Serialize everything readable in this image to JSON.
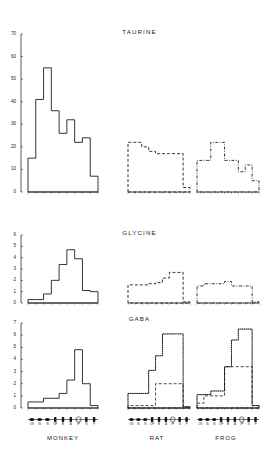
{
  "figure": {
    "species": [
      "MONKEY",
      "RAT",
      "FROG"
    ],
    "layer_ticks": [
      "OS",
      "IS",
      "N",
      "OP",
      "B",
      "A",
      "IP",
      "G",
      "F"
    ],
    "row_titles": [
      "TAURINE",
      "GLYCINE",
      "GABA"
    ]
  },
  "chart_data": [
    {
      "type": "bar",
      "title": "TAURINE",
      "subtitle": "MONKEY",
      "xlabel": "",
      "ylabel": "",
      "grid": false,
      "legend": "none",
      "line_style": "solid",
      "ylim": [
        0,
        70
      ],
      "yticks": [
        0,
        10,
        20,
        30,
        40,
        50,
        60,
        70
      ],
      "categories": [
        "OS",
        "IS",
        "N",
        "OP",
        "B",
        "A",
        "IP",
        "G",
        "F"
      ],
      "values": [
        15,
        41,
        55,
        36,
        26,
        32,
        22,
        24,
        7
      ]
    },
    {
      "type": "bar",
      "title": "TAURINE",
      "subtitle": "RAT",
      "grid": false,
      "legend": "none",
      "line_style": "dashed",
      "ylim": [
        0,
        70
      ],
      "categories": [
        "OS",
        "IS",
        "N",
        "OP",
        "B",
        "A",
        "IP",
        "G",
        "F"
      ],
      "values": [
        22,
        22,
        20,
        18,
        17,
        17,
        17,
        17,
        2
      ]
    },
    {
      "type": "bar",
      "title": "TAURINE",
      "subtitle": "FROG",
      "grid": false,
      "legend": "none",
      "line_style": "dashdot",
      "ylim": [
        0,
        70
      ],
      "categories": [
        "OS",
        "IS",
        "N",
        "OP",
        "B",
        "A",
        "IP",
        "G",
        "F"
      ],
      "values": [
        14,
        14,
        22,
        22,
        14,
        14,
        9,
        12,
        5
      ]
    },
    {
      "type": "bar",
      "title": "GLYCINE",
      "subtitle": "MONKEY",
      "grid": false,
      "legend": "none",
      "line_style": "solid",
      "ylim": [
        0,
        6
      ],
      "yticks": [
        0,
        1,
        2,
        3,
        4,
        5,
        6
      ],
      "categories": [
        "OS",
        "IS",
        "N",
        "OP",
        "B",
        "A",
        "IP",
        "G",
        "F"
      ],
      "values": [
        0.3,
        0.3,
        0.8,
        2.0,
        3.4,
        4.7,
        3.9,
        1.1,
        1.0
      ]
    },
    {
      "type": "bar",
      "title": "GLYCINE",
      "subtitle": "RAT",
      "grid": false,
      "legend": "none",
      "line_style": "dashed",
      "ylim": [
        0,
        6
      ],
      "categories": [
        "OS",
        "IS",
        "N",
        "OP",
        "B",
        "A",
        "IP",
        "G",
        "F"
      ],
      "values": [
        1.6,
        1.6,
        1.6,
        1.7,
        1.8,
        2.2,
        2.7,
        2.7,
        0.1
      ]
    },
    {
      "type": "bar",
      "title": "GLYCINE",
      "subtitle": "FROG",
      "grid": false,
      "legend": "none",
      "line_style": "dashdot",
      "ylim": [
        0,
        6
      ],
      "categories": [
        "OS",
        "IS",
        "N",
        "OP",
        "B",
        "A",
        "IP",
        "G",
        "F"
      ],
      "values": [
        1.5,
        1.7,
        1.7,
        1.7,
        1.9,
        1.5,
        1.5,
        1.5,
        0.1
      ]
    },
    {
      "type": "bar",
      "title": "GABA",
      "subtitle": "MONKEY",
      "grid": false,
      "legend": "none",
      "line_style": "solid",
      "ylim": [
        0,
        7
      ],
      "yticks": [
        0,
        1,
        2,
        3,
        4,
        5,
        6,
        7
      ],
      "categories": [
        "OS",
        "IS",
        "N",
        "OP",
        "B",
        "A",
        "IP",
        "G",
        "F"
      ],
      "values": [
        0.5,
        0.5,
        0.8,
        0.8,
        1.2,
        2.3,
        4.8,
        2.0,
        0.2
      ]
    },
    {
      "type": "bar",
      "title": "GABA",
      "subtitle": "RAT",
      "grid": false,
      "legend": "none",
      "line_style": "dotted",
      "ylim": [
        0,
        7
      ],
      "categories": [
        "OS",
        "IS",
        "N",
        "OP",
        "B",
        "A",
        "IP",
        "G",
        "F"
      ],
      "values": [
        1.2,
        1.2,
        1.2,
        3.1,
        4.3,
        6.1,
        6.1,
        6.1,
        0.1
      ],
      "series": [
        {
          "name": "overlay",
          "line_style": "dashed",
          "values": [
            0.2,
            0.2,
            0.2,
            0.2,
            2.0,
            2.0,
            2.0,
            2.0,
            0.1
          ]
        }
      ]
    },
    {
      "type": "bar",
      "title": "GABA",
      "subtitle": "FROG",
      "grid": false,
      "legend": "none",
      "line_style": "dotted",
      "ylim": [
        0,
        7
      ],
      "categories": [
        "OS",
        "IS",
        "N",
        "OP",
        "B",
        "A",
        "IP",
        "G",
        "F"
      ],
      "values": [
        1.1,
        1.1,
        1.4,
        1.4,
        3.4,
        5.6,
        6.5,
        6.5,
        0.2
      ],
      "series": [
        {
          "name": "overlay",
          "line_style": "dashed",
          "values": [
            0.4,
            1.0,
            1.0,
            1.0,
            3.4,
            3.4,
            3.4,
            3.4,
            0.2
          ]
        }
      ]
    }
  ]
}
